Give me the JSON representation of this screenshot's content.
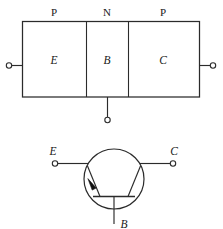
{
  "figure": {
    "stroke_color": "#2b2b2b",
    "background_color": "#ffffff",
    "arrow_fill_color": "#111111"
  },
  "structure": {
    "name": "pnp-layer-structure",
    "layers": [
      {
        "doping": "P",
        "terminal": "E"
      },
      {
        "doping": "N",
        "terminal": "B"
      },
      {
        "doping": "P",
        "terminal": "C"
      }
    ],
    "doping_labels": [
      "P",
      "N",
      "P"
    ],
    "region_labels": [
      "E",
      "B",
      "C"
    ],
    "terminals": [
      {
        "name": "emitter-terminal",
        "label": "E",
        "side": "left"
      },
      {
        "name": "base-terminal",
        "label": "B",
        "side": "bottom"
      },
      {
        "name": "collector-terminal",
        "label": "C",
        "side": "right"
      }
    ]
  },
  "symbol": {
    "name": "pnp-transistor-symbol",
    "type": "PNP",
    "emitter_label": "E",
    "collector_label": "C",
    "base_label": "B",
    "arrow_on": "emitter",
    "arrow_direction": "toward-base"
  }
}
